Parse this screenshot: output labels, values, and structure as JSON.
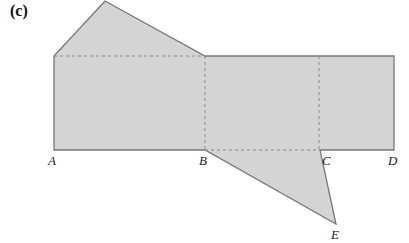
{
  "panel_label": "(c)",
  "colors": {
    "fill": "#d4d4d4",
    "stroke": "#777777",
    "dash": "#8a8a8a"
  },
  "points": {
    "A": "A",
    "B": "B",
    "C": "C",
    "D": "D",
    "E": "E"
  }
}
